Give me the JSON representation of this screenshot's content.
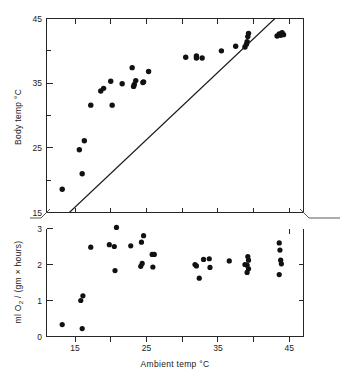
{
  "figure": {
    "name": "body-temperature-and-oxygen-consumption-vs-ambient-temperature",
    "background_color": "#ffffff",
    "point_color": "#111111",
    "axis_color": "#262626"
  },
  "chart_data": [
    {
      "panel": "top",
      "type": "scatter",
      "title": "",
      "xlabel": "",
      "ylabel": "Body temp °C",
      "xlim": [
        12,
        48
      ],
      "ylim": [
        15,
        45
      ],
      "xticks": [
        15,
        20,
        25,
        30,
        35,
        40,
        45
      ],
      "xtick_labels": [
        "",
        "",
        "",
        "",
        "",
        "",
        ""
      ],
      "yticks": [
        15,
        20,
        25,
        30,
        35,
        40,
        45
      ],
      "ytick_labels": [
        "15",
        "",
        "25",
        "",
        "35",
        "",
        "45"
      ],
      "grid": false,
      "legend": false,
      "annotations": [
        {
          "name": "isothermal-line",
          "type": "line",
          "description": "line of equality, body temp = ambient temp",
          "x": [
            15.2,
            44.0
          ],
          "y": [
            15.0,
            45.0
          ]
        }
      ],
      "series": [
        {
          "name": "Body temperature",
          "marker": "filled-circle",
          "points": [
            [
              14.2,
              18.6
            ],
            [
              17.0,
              21.0
            ],
            [
              16.6,
              24.7
            ],
            [
              17.3,
              26.1
            ],
            [
              18.2,
              31.6
            ],
            [
              21.2,
              31.6
            ],
            [
              19.6,
              33.8
            ],
            [
              20.0,
              34.2
            ],
            [
              22.6,
              34.9
            ],
            [
              21.0,
              35.3
            ],
            [
              24.2,
              34.5
            ],
            [
              24.3,
              34.8
            ],
            [
              24.5,
              35.4
            ],
            [
              25.5,
              35.1
            ],
            [
              25.6,
              35.2
            ],
            [
              24.0,
              37.4
            ],
            [
              26.3,
              36.8
            ],
            [
              31.5,
              39.0
            ],
            [
              33.0,
              39.2
            ],
            [
              33.0,
              38.9
            ],
            [
              33.8,
              38.9
            ],
            [
              36.5,
              40.0
            ],
            [
              38.5,
              40.7
            ],
            [
              39.8,
              40.6
            ],
            [
              40.0,
              41.0
            ],
            [
              40.1,
              41.4
            ],
            [
              40.2,
              42.2
            ],
            [
              40.3,
              42.7
            ],
            [
              44.3,
              42.3
            ],
            [
              44.6,
              42.6
            ],
            [
              44.8,
              42.4
            ],
            [
              45.0,
              42.8
            ],
            [
              45.2,
              42.5
            ]
          ]
        }
      ]
    },
    {
      "panel": "bottom",
      "type": "scatter",
      "title": "",
      "xlabel": "Ambient temp °C",
      "ylabel": "ml O2 / (gm × hours)",
      "ylabel_display": "ml O₂ / (gm × hours)",
      "xlim": [
        12,
        48
      ],
      "ylim": [
        0,
        3
      ],
      "xticks": [
        15,
        20,
        25,
        30,
        35,
        40,
        45
      ],
      "xtick_labels": [
        "15",
        "",
        "25",
        "",
        "35",
        "",
        "45"
      ],
      "yticks": [
        0,
        1,
        2,
        3
      ],
      "ytick_labels": [
        "0",
        "1",
        "2",
        "3"
      ],
      "grid": false,
      "legend": false,
      "series": [
        {
          "name": "Oxygen consumption",
          "marker": "filled-circle",
          "points": [
            [
              14.2,
              0.33
            ],
            [
              17.0,
              0.22
            ],
            [
              16.8,
              1.0
            ],
            [
              17.1,
              1.13
            ],
            [
              18.2,
              2.48
            ],
            [
              20.8,
              2.55
            ],
            [
              21.5,
              2.5
            ],
            [
              21.8,
              3.03
            ],
            [
              21.6,
              1.83
            ],
            [
              23.8,
              2.52
            ],
            [
              25.3,
              2.62
            ],
            [
              25.6,
              2.8
            ],
            [
              25.2,
              1.95
            ],
            [
              25.4,
              2.03
            ],
            [
              26.8,
              2.28
            ],
            [
              27.1,
              2.28
            ],
            [
              26.9,
              1.93
            ],
            [
              32.8,
              2.0
            ],
            [
              33.0,
              1.96
            ],
            [
              34.0,
              2.14
            ],
            [
              33.4,
              1.62
            ],
            [
              34.8,
              2.16
            ],
            [
              34.9,
              1.92
            ],
            [
              37.6,
              2.1
            ],
            [
              39.8,
              2.0
            ],
            [
              40.2,
              2.22
            ],
            [
              40.3,
              2.12
            ],
            [
              40.1,
              1.98
            ],
            [
              40.3,
              1.88
            ],
            [
              40.1,
              1.78
            ],
            [
              44.6,
              2.6
            ],
            [
              44.7,
              2.4
            ],
            [
              44.8,
              2.12
            ],
            [
              44.9,
              2.02
            ],
            [
              44.6,
              1.72
            ]
          ]
        }
      ]
    }
  ],
  "labels": {
    "top_y_axis_title": "Body temp °C",
    "bottom_y_axis_title_prefix": "ml O",
    "bottom_y_axis_title_sub": "2",
    "bottom_y_axis_title_suffix": " / (gm × hours)",
    "x_axis_title": "Ambient temp °C",
    "top_y_ticks": [
      "45",
      "35",
      "25",
      "15"
    ],
    "bottom_y_ticks": [
      "3",
      "2",
      "1",
      "0"
    ],
    "x_ticks": [
      "15",
      "25",
      "35",
      "45"
    ]
  }
}
